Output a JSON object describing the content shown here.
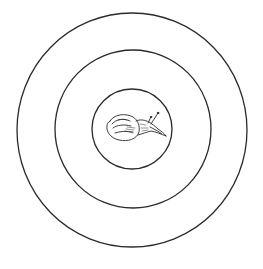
{
  "illustration": {
    "description": "Line drawing of a snail at the center of three concentric circles",
    "background_color": "#ffffff",
    "stroke_color": "#2a2a2a",
    "rings": [
      {
        "name": "outer-ring",
        "cx": 132,
        "cy": 130,
        "rx": 115,
        "ry": 117
      },
      {
        "name": "middle-ring",
        "cx": 133,
        "cy": 129,
        "rx": 78,
        "ry": 79
      },
      {
        "name": "inner-ring",
        "cx": 132,
        "cy": 129,
        "rx": 40,
        "ry": 40
      }
    ],
    "subject": {
      "name": "snail",
      "icon": "snail-icon",
      "position": {
        "x": 106,
        "y": 112,
        "width": 62,
        "height": 30
      }
    }
  }
}
